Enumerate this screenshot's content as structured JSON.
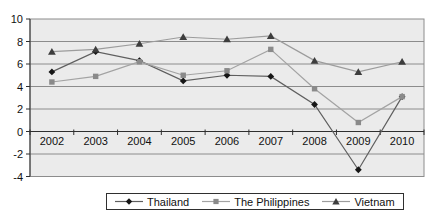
{
  "chart_data": {
    "type": "line",
    "title": "",
    "xlabel": "",
    "ylabel": "",
    "categories": [
      "2002",
      "2003",
      "2004",
      "2005",
      "2006",
      "2007",
      "2008",
      "2009",
      "2010"
    ],
    "series": [
      {
        "name": "Thailand",
        "marker": "diamond",
        "line_color": "#5f5f5f",
        "marker_color": "#161616",
        "values": [
          5.3,
          7.1,
          6.3,
          4.5,
          5.0,
          4.9,
          2.4,
          -3.4,
          3.1
        ]
      },
      {
        "name": "The Philippines",
        "marker": "square",
        "line_color": "#a3a3a3",
        "marker_color": "#8a8a8a",
        "values": [
          4.4,
          4.9,
          6.2,
          5.0,
          5.4,
          7.3,
          3.8,
          0.8,
          3.1
        ]
      },
      {
        "name": "Vietnam",
        "marker": "triangle",
        "line_color": "#9c9c9c",
        "marker_color": "#3d3d3d",
        "values": [
          7.1,
          7.3,
          7.8,
          8.4,
          8.2,
          8.5,
          6.3,
          5.3,
          6.2
        ]
      }
    ],
    "ylim": [
      -4,
      10
    ],
    "ytick_step": 2,
    "yticks": [
      "10",
      "8",
      "6",
      "4",
      "2",
      "0",
      "-2",
      "-4"
    ],
    "grid": true,
    "legend_position": "bottom",
    "plot_bg": "#ebebeb",
    "grid_color": "#8c8c8c",
    "axis_color": "#2f2f2f",
    "text_color": "#111111",
    "legend_border_color": "#2f2f2f"
  }
}
